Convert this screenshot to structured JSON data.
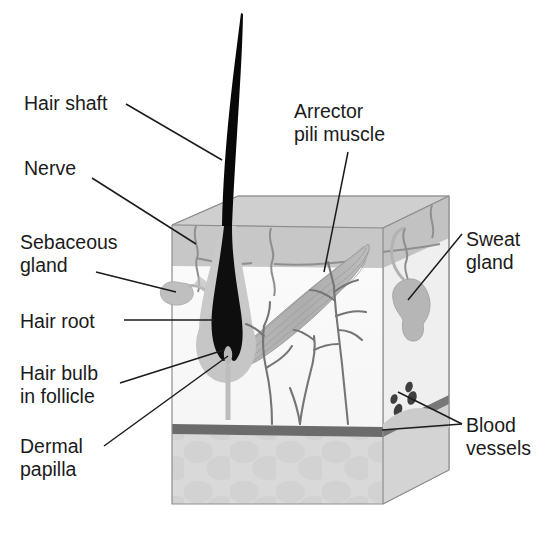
{
  "figure": {
    "type": "anatomical-diagram",
    "background_color": "#ffffff",
    "text_color": "#1b1b1b"
  },
  "labels": {
    "hair_shaft": "Hair shaft",
    "nerve": "Nerve",
    "sebaceous_gland": "Sebaceous\ngland",
    "hair_root": "Hair root",
    "hair_bulb": "Hair bulb\nin follicle",
    "dermal_papilla": "Dermal\npapilla",
    "arrector_pili_muscle": "Arrector\npili muscle",
    "sweat_gland": "Sweat\ngland",
    "blood_vessels": "Blood\nvessels"
  },
  "structures": [
    {
      "name": "hair-shaft",
      "color": "#0a0a0a",
      "description": "tapered black hair rising above skin surface"
    },
    {
      "name": "epidermis-top-surface",
      "color": "#cfcfcf",
      "description": "light gray parallelogram top face of skin block"
    },
    {
      "name": "epidermis-front-band",
      "color": "#c0c0c0",
      "description": "gray horizontal band below top face"
    },
    {
      "name": "dermis",
      "color": "#f7f7f7",
      "description": "pale front face of block"
    },
    {
      "name": "subcutaneous-fat",
      "color": "#d8d8d8",
      "description": "lower lobular layer with blob pattern"
    },
    {
      "name": "blood-vessel-band",
      "color": "#6e6e6e",
      "description": "dark horizontal vessel layer"
    },
    {
      "name": "arrector-pili-muscle",
      "color": "#b4b4b4",
      "description": "spindle shaped striated muscle"
    },
    {
      "name": "sebaceous-gland",
      "color": "#bdbdbd",
      "description": "small lobe on left of follicle"
    },
    {
      "name": "hair-follicle-sheath",
      "color": "#c6c6c6",
      "description": "gray sheath around hair root"
    },
    {
      "name": "hair-bulb",
      "color": "#101010",
      "description": "black bulb with notch at base"
    },
    {
      "name": "dermal-papilla",
      "color": "#b9b9b9",
      "description": "papilla indenting base of bulb"
    },
    {
      "name": "sweat-gland",
      "color": "#b8b8b8",
      "description": "coiled gray gland with duct"
    },
    {
      "name": "nerve-fibers",
      "color": "#8a8a8a",
      "description": "wavy fibers near epidermis"
    },
    {
      "name": "vessel-branches",
      "color": "#777777",
      "description": "branching vessel trees in dermis"
    },
    {
      "name": "vessel-cross-sections",
      "color": "#4a4a4a",
      "description": "small dark dots at right"
    }
  ],
  "leader_lines": {
    "color": "#1b1b1b",
    "width": 1.4,
    "count": 10
  }
}
